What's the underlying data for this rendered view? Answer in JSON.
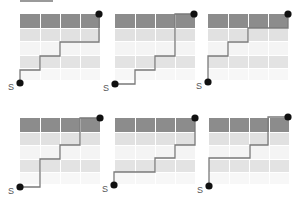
{
  "header_bar": {
    "x": 20,
    "y": 0,
    "w": 33,
    "h": 2,
    "color": "#9a9a9a"
  },
  "colors": {
    "row_fills": [
      "#8c8c8c",
      "#e1e1e1",
      "#f4f4f4",
      "#e3e3e3",
      "#f7f7f7"
    ],
    "path": "#7a7a7a",
    "dot": "#111111",
    "grid_gap": "#ffffff"
  },
  "grid": {
    "cols": 4,
    "col_w": 20,
    "row_heights": [
      14,
      13,
      14,
      13,
      12
    ]
  },
  "panels": [
    {
      "id": 1,
      "origin": [
        20,
        14
      ],
      "start": [
        20,
        83
      ],
      "end": [
        99,
        14
      ],
      "start_label": "S",
      "path": [
        [
          20,
          83
        ],
        [
          20,
          70
        ],
        [
          40,
          70
        ],
        [
          40,
          56
        ],
        [
          60,
          56
        ],
        [
          60,
          42
        ],
        [
          99,
          42
        ],
        [
          99,
          14
        ]
      ]
    },
    {
      "id": 2,
      "origin": [
        115,
        14
      ],
      "start": [
        115,
        84
      ],
      "end": [
        194,
        14
      ],
      "start_label": "S",
      "path": [
        [
          115,
          84
        ],
        [
          135,
          84
        ],
        [
          135,
          70
        ],
        [
          155,
          70
        ],
        [
          155,
          56
        ],
        [
          175,
          56
        ],
        [
          175,
          14
        ],
        [
          194,
          14
        ]
      ]
    },
    {
      "id": 3,
      "origin": [
        208,
        14
      ],
      "start": [
        208,
        82
      ],
      "end": [
        288,
        14
      ],
      "start_label": "S",
      "path": [
        [
          208,
          82
        ],
        [
          208,
          56
        ],
        [
          228,
          56
        ],
        [
          228,
          42
        ],
        [
          248,
          42
        ],
        [
          248,
          28
        ],
        [
          288,
          28
        ],
        [
          288,
          14
        ]
      ]
    },
    {
      "id": 4,
      "origin": [
        20,
        118
      ],
      "start": [
        20,
        187
      ],
      "end": [
        100,
        118
      ],
      "start_label": "S",
      "path": [
        [
          20,
          187
        ],
        [
          40,
          187
        ],
        [
          40,
          159
        ],
        [
          60,
          159
        ],
        [
          60,
          145
        ],
        [
          80,
          145
        ],
        [
          80,
          118
        ],
        [
          100,
          118
        ]
      ]
    },
    {
      "id": 5,
      "origin": [
        115,
        118
      ],
      "start": [
        114,
        185
      ],
      "end": [
        195,
        118
      ],
      "start_label": "S",
      "path": [
        [
          114,
          185
        ],
        [
          114,
          172
        ],
        [
          155,
          172
        ],
        [
          155,
          158
        ],
        [
          175,
          158
        ],
        [
          175,
          145
        ],
        [
          195,
          145
        ],
        [
          195,
          118
        ]
      ]
    },
    {
      "id": 6,
      "origin": [
        209,
        118
      ],
      "start": [
        209,
        186
      ],
      "end": [
        288,
        117
      ],
      "start_label": "S",
      "path": [
        [
          209,
          186
        ],
        [
          209,
          158
        ],
        [
          250,
          158
        ],
        [
          250,
          145
        ],
        [
          268,
          145
        ],
        [
          268,
          117
        ],
        [
          288,
          117
        ]
      ]
    }
  ]
}
